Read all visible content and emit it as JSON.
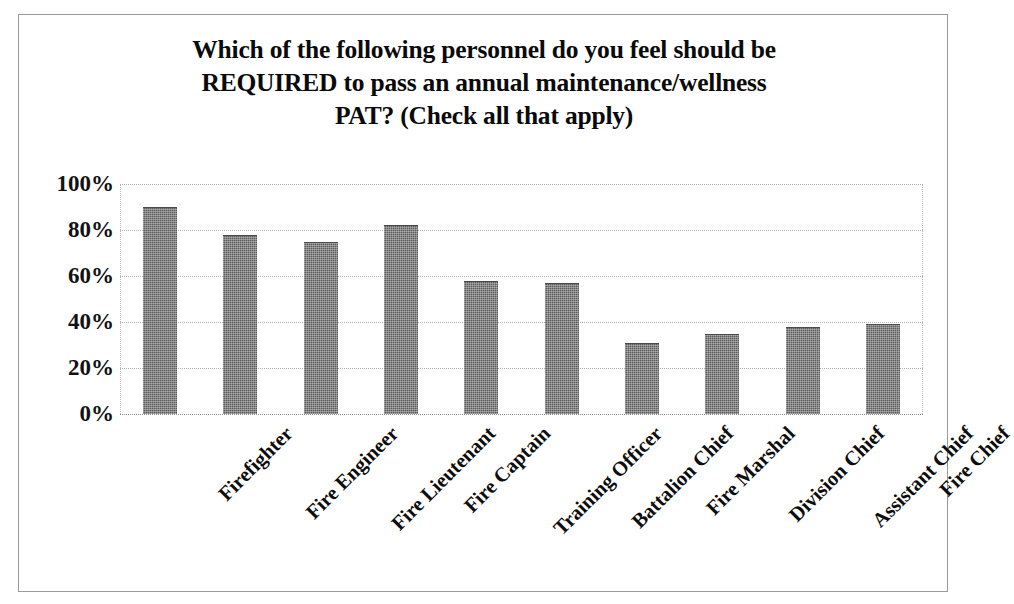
{
  "chart_data": {
    "type": "bar",
    "title": "Which of the following personnel do you feel should be\nREQUIRED to pass an annual maintenance/wellness\nPAT? (Check all that apply)",
    "xlabel": "",
    "ylabel": "",
    "ylim": [
      0,
      100
    ],
    "ytick_labels": [
      "100%",
      "80%",
      "60%",
      "40%",
      "20%",
      "0%"
    ],
    "ytick_values": [
      100,
      80,
      60,
      40,
      20,
      0
    ],
    "grid": "horizontal-dotted",
    "legend": "none",
    "bar_color": "#5c5c5c",
    "categories": [
      "Firefighter",
      "Fire Engineer",
      "Fire Lieutenant",
      "Fire Captain",
      "Training Officer",
      "Battalion Chief",
      "Fire Marshal",
      "Division Chief",
      "Assistant Chief",
      "Fire Chief"
    ],
    "values": [
      90,
      78,
      75,
      82,
      58,
      57,
      31,
      35,
      38,
      39
    ]
  }
}
